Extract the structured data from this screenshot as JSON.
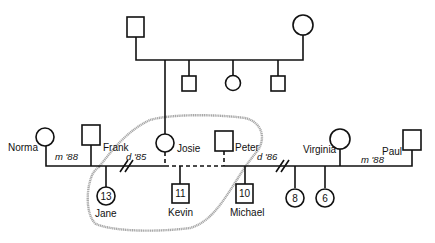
{
  "diagram": {
    "type": "genogram",
    "grandparents": {
      "father": {
        "sex": "male"
      },
      "mother": {
        "sex": "female"
      },
      "children": [
        {
          "name": "Josie",
          "sex": "female"
        },
        {
          "sex": "male"
        },
        {
          "sex": "female"
        },
        {
          "sex": "male"
        }
      ]
    },
    "people": {
      "norma": {
        "name": "Norma",
        "sex": "female"
      },
      "frank": {
        "name": "Frank",
        "sex": "male"
      },
      "josie": {
        "name": "Josie",
        "sex": "female"
      },
      "peter": {
        "name": "Peter",
        "sex": "male"
      },
      "virginia": {
        "name": "Virginia",
        "sex": "female"
      },
      "paul": {
        "name": "Paul",
        "sex": "male"
      },
      "jane": {
        "name": "Jane",
        "sex": "female",
        "age": "13"
      },
      "kevin": {
        "name": "Kevin",
        "sex": "male",
        "age": "11"
      },
      "michael": {
        "name": "Michael",
        "sex": "male",
        "age": "10"
      },
      "daughter8": {
        "sex": "female",
        "age": "8"
      },
      "daughter6": {
        "sex": "female",
        "age": "6"
      }
    },
    "relationships": {
      "norma_frank": {
        "label": "m '88",
        "type": "married"
      },
      "frank_josie": {
        "label": "d '85",
        "type": "divorced"
      },
      "josie_peter": {
        "type": "cohabiting"
      },
      "peter_virginia": {
        "label": "d '86",
        "type": "divorced"
      },
      "virginia_paul": {
        "label": "m '88",
        "type": "married"
      }
    },
    "household_boundary": {
      "members": [
        "Josie",
        "Peter",
        "Jane",
        "Kevin",
        "Michael"
      ]
    }
  }
}
